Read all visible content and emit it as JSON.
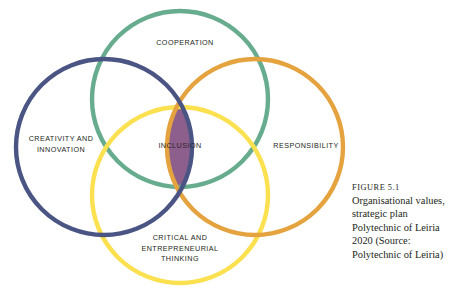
{
  "figure": {
    "caption_label": "FIGURE 5.1",
    "caption_text": "Organisational values, strategic plan Polytechnic of Leiria 2020 (Source: Polytechnic of Leiria)"
  },
  "diagram": {
    "type": "venn",
    "center_label": "INCLUSION",
    "center_fill": "#8d5f8d",
    "circles": [
      {
        "id": "cooperation",
        "label": "COOPERATION",
        "color": "#67ac8e",
        "position": "top",
        "cx": 180,
        "cy": 99,
        "r": 88
      },
      {
        "id": "creativity-and-innovation",
        "label": "CREATIVITY AND\nINNOVATION",
        "color": "#4a5584",
        "position": "left",
        "cx": 104,
        "cy": 147,
        "r": 88
      },
      {
        "id": "responsibility",
        "label": "RESPONSIBILITY",
        "color": "#e5a33f",
        "position": "right",
        "cx": 255,
        "cy": 147,
        "r": 88
      },
      {
        "id": "critical-and-entrepreneurial-thinking",
        "label": "CRITICAL AND\nENTREPRENEURIAL\nTHINKING",
        "color": "#fbe04f",
        "position": "bottom",
        "cx": 180,
        "cy": 195,
        "r": 88
      }
    ]
  }
}
